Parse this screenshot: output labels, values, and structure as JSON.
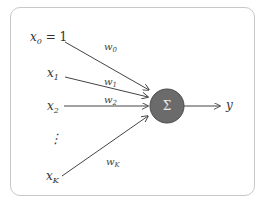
{
  "diagram": {
    "type": "perceptron",
    "inputs": [
      {
        "label": "x₀ = 1",
        "sub": "0",
        "weight": "w₀"
      },
      {
        "label": "x₁",
        "sub": "1",
        "weight": "w₁"
      },
      {
        "label": "x₂",
        "sub": "2",
        "weight": "w₂"
      },
      {
        "label": "⋮",
        "weight": ""
      },
      {
        "label": "xₖ",
        "sub": "K",
        "weight": "wₖ"
      }
    ],
    "node": {
      "label": "Σ",
      "fill": "#6b6b6b"
    },
    "output": {
      "label": "y"
    },
    "labels": {
      "x0": "x",
      "x0_sub": "0",
      "x0_eq": " = 1",
      "x1": "x",
      "x1_sub": "1",
      "x2": "x",
      "x2_sub": "2",
      "dots": "⋮",
      "xK": "x",
      "xK_sub": "K",
      "w0": "w",
      "w0_sub": "0",
      "w1": "w",
      "w1_sub": "1",
      "w2": "w",
      "w2_sub": "2",
      "wK": "w",
      "wK_sub": "K",
      "sigma": "Σ",
      "y": "y"
    }
  }
}
